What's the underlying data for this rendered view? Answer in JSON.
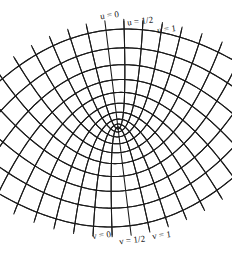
{
  "figure": {
    "width": 232,
    "height": 254,
    "background_color": "#ffffff",
    "line_color": "#1a1a1a"
  },
  "labels": {
    "top": [
      {
        "text": "u = 0",
        "variable": "u",
        "value": "0"
      },
      {
        "text": "u = 1/2",
        "variable": "u",
        "value": "1/2"
      },
      {
        "text": "u = 1",
        "variable": "u",
        "value": "1"
      }
    ],
    "bottom": [
      {
        "text": "v = 0",
        "variable": "v",
        "value": "0"
      },
      {
        "text": "v = 1/2",
        "variable": "v",
        "value": "1/2"
      },
      {
        "text": "v = 1",
        "variable": "v",
        "value": "1"
      }
    ]
  },
  "chart_data": {
    "type": "line",
    "title": "",
    "xlabel": "",
    "ylabel": "",
    "focus": {
      "x": 118,
      "y": 128
    },
    "grid": false,
    "legend_position": "none",
    "families": [
      {
        "name": "u = constant",
        "orientation": "opening-downward",
        "label_side": "top",
        "values": [
          0,
          0.25,
          0.5,
          0.75,
          1.0,
          1.25,
          1.5,
          1.75,
          2.0,
          2.25,
          2.5
        ]
      },
      {
        "name": "v = constant",
        "orientation": "opening-upward",
        "label_side": "bottom",
        "values": [
          0,
          0.25,
          0.5,
          0.75,
          1.0,
          1.25,
          1.5,
          1.75,
          2.0,
          2.25,
          2.5
        ]
      }
    ],
    "labeled_curves": {
      "u": [
        "0",
        "1/2",
        "1"
      ],
      "v": [
        "0",
        "1/2",
        "1"
      ]
    }
  }
}
